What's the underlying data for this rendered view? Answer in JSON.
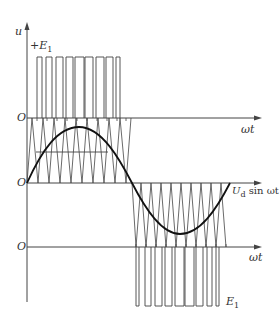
{
  "diagram": {
    "labels": {
      "y_axis": "u",
      "plus_e1": "+E",
      "plus_e1_sub": "1",
      "origin_top": "O",
      "origin_middle": "O",
      "origin_bottom": "O",
      "omega_t_top": "ωt",
      "omega_t_bottom": "ωt",
      "modulating_wave": "U",
      "modulating_wave_sub": "d",
      "modulating_wave_suffix": " sin ωt",
      "minus_e1": "E",
      "minus_e1_sub": "1"
    },
    "positive_pulses_count": 9,
    "negative_pulses_count": 9,
    "carrier_periods_per_half_cycle": 9
  }
}
